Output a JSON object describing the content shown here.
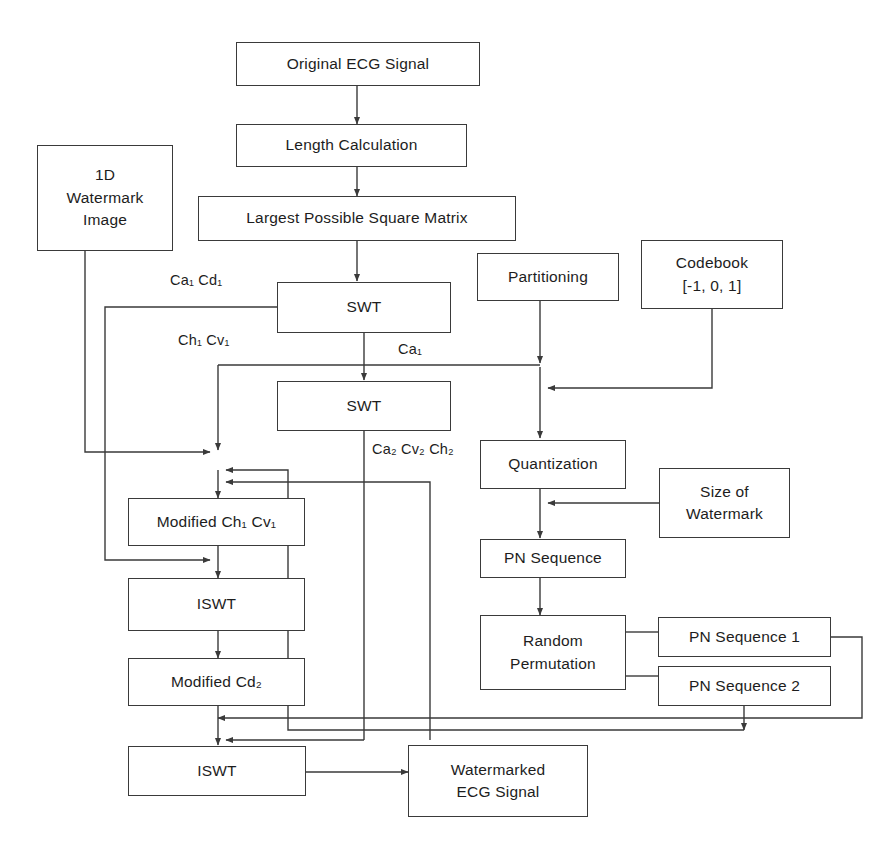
{
  "diagram": {
    "stroke_color": "#3a3a3a",
    "background_color": "#ffffff",
    "nodes": {
      "original_ecg": "Original ECG Signal",
      "length_calculation": "Length Calculation",
      "largest_matrix": "Largest Possible Square Matrix",
      "watermark_1d_l1": "1D",
      "watermark_1d_l2": "Watermark",
      "watermark_1d_l3": "Image",
      "swt_1": "SWT",
      "swt_2": "SWT",
      "partitioning": "Partitioning",
      "codebook_l1": "Codebook",
      "codebook_l2": "[-1, 0, 1]",
      "quantization": "Quantization",
      "size_of_watermark_l1": "Size of",
      "size_of_watermark_l2": "Watermark",
      "pn_sequence": "PN Sequence",
      "random_permutation_l1": "Random",
      "random_permutation_l2": "Permutation",
      "pn_sequence_1": "PN Sequence 1",
      "pn_sequence_2": "PN Sequence 2",
      "modified_ch_cv": "Modified Ch₁ Cv₁",
      "iswt_1": "ISWT",
      "modified_cd2": "Modified Cd₂",
      "iswt_2": "ISWT",
      "watermarked_l1": "Watermarked",
      "watermarked_l2": "ECG Signal"
    },
    "edge_labels": {
      "ca1_cd1": "Ca₁ Cd₁",
      "ch1_cv1": "Ch₁ Cv₁",
      "ca1": "Ca₁",
      "ca2_cv2_ch2": "Ca₂ Cv₂ Ch₂"
    }
  }
}
